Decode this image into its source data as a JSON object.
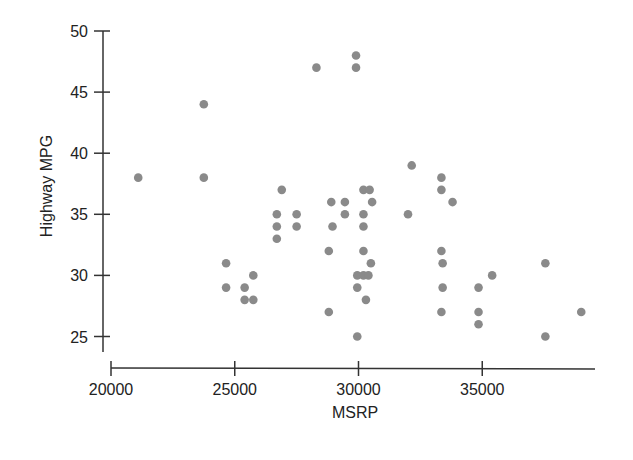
{
  "chart_data": {
    "type": "scatter",
    "title": "",
    "xlabel": "MSRP",
    "ylabel": "Highway MPG",
    "xlim": [
      20000,
      39000
    ],
    "ylim": [
      25,
      50
    ],
    "grid": false,
    "legend": null,
    "x_ticks": [
      20000,
      25000,
      30000,
      35000
    ],
    "x_tick_labels": [
      "20000",
      "25000",
      "30000",
      "35000"
    ],
    "y_ticks": [
      25,
      30,
      35,
      40,
      45,
      50
    ],
    "y_tick_labels": [
      "25",
      "30",
      "35",
      "40",
      "45",
      "50"
    ],
    "point_color": "#8a8a8a",
    "points": [
      {
        "x": 21100,
        "y": 38
      },
      {
        "x": 23750,
        "y": 44
      },
      {
        "x": 23750,
        "y": 38
      },
      {
        "x": 24650,
        "y": 31
      },
      {
        "x": 24650,
        "y": 29
      },
      {
        "x": 25400,
        "y": 29
      },
      {
        "x": 25750,
        "y": 30
      },
      {
        "x": 25400,
        "y": 28
      },
      {
        "x": 25750,
        "y": 28
      },
      {
        "x": 26900,
        "y": 37
      },
      {
        "x": 26700,
        "y": 35
      },
      {
        "x": 26700,
        "y": 34
      },
      {
        "x": 26700,
        "y": 33
      },
      {
        "x": 27500,
        "y": 35
      },
      {
        "x": 27500,
        "y": 34
      },
      {
        "x": 28300,
        "y": 47
      },
      {
        "x": 28900,
        "y": 36
      },
      {
        "x": 28950,
        "y": 34
      },
      {
        "x": 28800,
        "y": 32
      },
      {
        "x": 28800,
        "y": 27
      },
      {
        "x": 29450,
        "y": 36
      },
      {
        "x": 29450,
        "y": 35
      },
      {
        "x": 29900,
        "y": 48
      },
      {
        "x": 29900,
        "y": 47
      },
      {
        "x": 30200,
        "y": 37
      },
      {
        "x": 30450,
        "y": 37
      },
      {
        "x": 30550,
        "y": 36
      },
      {
        "x": 30200,
        "y": 35
      },
      {
        "x": 30200,
        "y": 34
      },
      {
        "x": 30200,
        "y": 32
      },
      {
        "x": 30500,
        "y": 31
      },
      {
        "x": 29950,
        "y": 30
      },
      {
        "x": 30200,
        "y": 30
      },
      {
        "x": 30400,
        "y": 30
      },
      {
        "x": 29950,
        "y": 29
      },
      {
        "x": 30300,
        "y": 28
      },
      {
        "x": 29950,
        "y": 25
      },
      {
        "x": 32150,
        "y": 39
      },
      {
        "x": 32000,
        "y": 35
      },
      {
        "x": 33350,
        "y": 38
      },
      {
        "x": 33350,
        "y": 37
      },
      {
        "x": 33800,
        "y": 36
      },
      {
        "x": 33350,
        "y": 32
      },
      {
        "x": 33400,
        "y": 31
      },
      {
        "x": 33400,
        "y": 29
      },
      {
        "x": 33350,
        "y": 27
      },
      {
        "x": 34850,
        "y": 29
      },
      {
        "x": 34850,
        "y": 27
      },
      {
        "x": 34850,
        "y": 26
      },
      {
        "x": 35400,
        "y": 30
      },
      {
        "x": 37550,
        "y": 31
      },
      {
        "x": 37550,
        "y": 25
      },
      {
        "x": 39000,
        "y": 27
      }
    ]
  }
}
